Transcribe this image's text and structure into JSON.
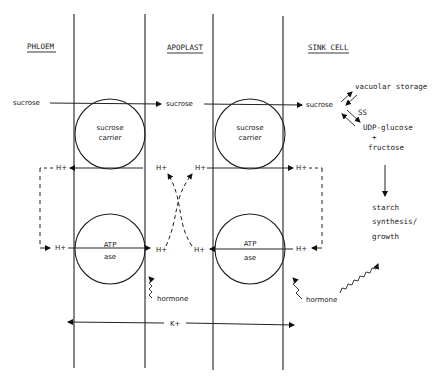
{
  "headers": {
    "phloem": "PHLOEM",
    "apoplast": "APOPLAST",
    "sink_cell": "SINK CELL"
  },
  "sucrose": {
    "phloem": "sucrose",
    "apoplast": "sucrose",
    "sink": "sucrose"
  },
  "carriers": {
    "left_line1": "sucrose",
    "left_line2": "carrier",
    "right_line1": "sucrose",
    "right_line2": "carrier"
  },
  "atpase": {
    "left_line1": "ATP",
    "left_line2": "ase",
    "right_line1": "ATP",
    "right_line2": "ase"
  },
  "protons": {
    "label": "H+"
  },
  "hormone": {
    "left": "hormone",
    "right": "hormone"
  },
  "potassium": {
    "label": "K+"
  },
  "sink_fate": {
    "vacuolar": "vacuolar storage",
    "enzyme": "SS",
    "products_line1": "UDP-glucose",
    "products_line2": "+",
    "products_line3": "fructose",
    "starch_line1": "starch",
    "starch_line2": "synthesis/",
    "starch_line3": "growth"
  }
}
